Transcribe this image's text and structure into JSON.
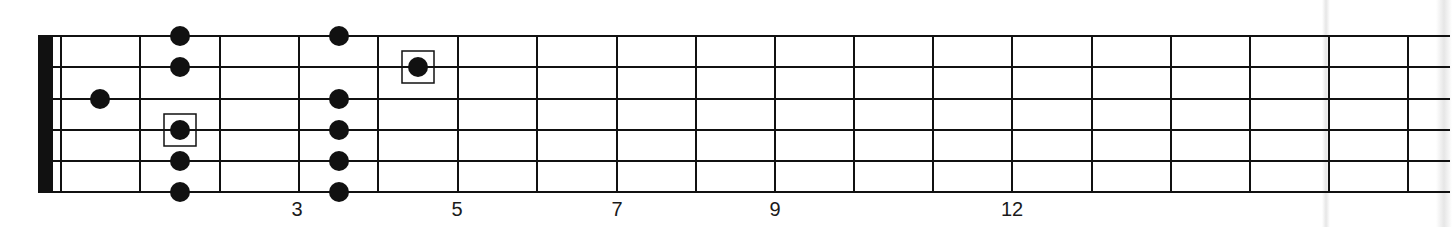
{
  "diagram": {
    "type": "guitar-fretboard",
    "string_count": 6,
    "fret_count_visible": 17,
    "colors": {
      "ink": "#111111",
      "background": "#ffffff",
      "fold_shadow": "#e6e6e6"
    },
    "geometry": {
      "nut": {
        "x": 38,
        "width": 15
      },
      "nut_line_x": 61,
      "string_y": [
        36,
        67,
        99,
        130,
        161,
        192
      ],
      "fret_x": [
        140,
        220,
        299,
        378,
        458,
        537,
        617,
        696,
        775,
        854,
        933,
        1012,
        1092,
        1171,
        1250,
        1329,
        1408
      ],
      "string_end_x": 1450,
      "dot_radius": 10,
      "box_size": 32
    },
    "fret_labels": [
      {
        "text": "3",
        "fret": 3,
        "x": 297
      },
      {
        "text": "5",
        "fret": 5,
        "x": 457
      },
      {
        "text": "7",
        "fret": 7,
        "x": 617
      },
      {
        "text": "9",
        "fret": 9,
        "x": 775
      },
      {
        "text": "12",
        "fret": 12,
        "x": 1012
      }
    ],
    "notes": [
      {
        "string": 3,
        "fret": 1,
        "x": 100,
        "boxed": false
      },
      {
        "string": 1,
        "fret": 2,
        "x": 180,
        "boxed": false
      },
      {
        "string": 2,
        "fret": 2,
        "x": 180,
        "boxed": false
      },
      {
        "string": 4,
        "fret": 2,
        "x": 180,
        "boxed": true
      },
      {
        "string": 5,
        "fret": 2,
        "x": 180,
        "boxed": false
      },
      {
        "string": 6,
        "fret": 2,
        "x": 180,
        "boxed": false
      },
      {
        "string": 1,
        "fret": 4,
        "x": 339,
        "boxed": false
      },
      {
        "string": 3,
        "fret": 4,
        "x": 339,
        "boxed": false
      },
      {
        "string": 4,
        "fret": 4,
        "x": 339,
        "boxed": false
      },
      {
        "string": 5,
        "fret": 4,
        "x": 339,
        "boxed": false
      },
      {
        "string": 6,
        "fret": 4,
        "x": 339,
        "boxed": false
      },
      {
        "string": 2,
        "fret": 5,
        "x": 418,
        "boxed": true
      }
    ],
    "fold_bands": [
      {
        "x": 1322,
        "width": 8
      },
      {
        "x": 1436,
        "width": 16
      }
    ]
  }
}
